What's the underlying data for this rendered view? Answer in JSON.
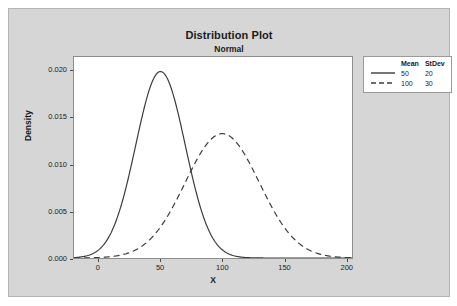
{
  "chart_data": {
    "type": "line",
    "title": "Distribution Plot",
    "subtitle": "Normal",
    "xlabel": "X",
    "ylabel": "Density",
    "xlim": [
      -20,
      205
    ],
    "ylim": [
      0,
      0.0215
    ],
    "xticks": [
      "0",
      "50",
      "100",
      "150",
      "200"
    ],
    "xtick_values": [
      0,
      50,
      100,
      150,
      200
    ],
    "yticks": [
      "0.000",
      "0.005",
      "0.010",
      "0.015",
      "0.020"
    ],
    "ytick_values": [
      0.0,
      0.005,
      0.01,
      0.015,
      0.02
    ],
    "grid": false,
    "legend_position": "top-right",
    "legend_headers": [
      "Mean",
      "StDev"
    ],
    "series": [
      {
        "name": "Normal(50, 20)",
        "mean": 50,
        "stdev": 20,
        "style": "solid",
        "color": "#3b3b3b",
        "peak_density": 0.019947
      },
      {
        "name": "Normal(100, 30)",
        "mean": 100,
        "stdev": 30,
        "style": "dashed",
        "color": "#3b3b3b",
        "peak_density": 0.013298
      }
    ]
  },
  "legend": {
    "header_mean": "Mean",
    "header_stdev": "StDev",
    "rows": [
      {
        "mean": "50",
        "stdev": "20",
        "style": "solid"
      },
      {
        "mean": "100",
        "stdev": "30",
        "style": "dashed"
      }
    ]
  },
  "colors": {
    "panel_background": "#d6d6d6",
    "plot_background": "#ffffff",
    "curve": "#3b3b3b",
    "axis": "#8d8d8d",
    "text": "#1b1b1b"
  }
}
